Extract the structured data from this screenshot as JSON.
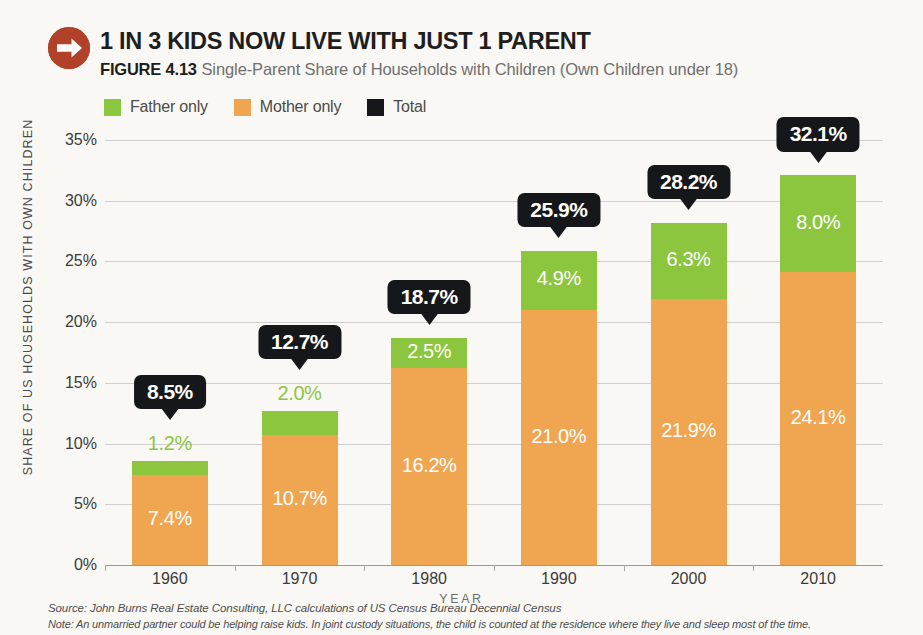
{
  "header": {
    "badge_icon": "arrow-right-circle-icon",
    "badge_color": "#b2412a",
    "headline": "1 IN 3 KIDS NOW LIVE WITH JUST 1 PARENT",
    "figure_number": "FIGURE 4.13",
    "figure_caption": "Single-Parent Share of Households with Children (Own Children under 18)"
  },
  "legend": {
    "items": [
      {
        "label": "Father only",
        "color": "#8cc63e"
      },
      {
        "label": "Mother only",
        "color": "#f0a550"
      },
      {
        "label": "Total",
        "color": "#16171a"
      }
    ]
  },
  "footnotes": {
    "source": "Source: John Burns Real Estate Consulting, LLC calculations of US Census Bureau Decennial Census",
    "note": "Note: An unmarried partner could be helping raise kids. In joint custody situations, the child is counted at the residence where they live and sleep most of the time."
  },
  "chart_data": {
    "type": "bar",
    "subtype": "stacked",
    "title": "Single-Parent Share of Households with Children (Own Children under 18)",
    "xlabel": "YEAR",
    "ylabel": "SHARE OF US HOUSEHOLDS WITH OWN CHILDREN",
    "categories": [
      "1960",
      "1970",
      "1980",
      "1990",
      "2000",
      "2010"
    ],
    "ylim": [
      0,
      35
    ],
    "ytick_labels": [
      "0%",
      "5%",
      "10%",
      "15%",
      "20%",
      "25%",
      "30%",
      "35%"
    ],
    "ytick_values": [
      0,
      5,
      10,
      15,
      20,
      25,
      30,
      35
    ],
    "grid": true,
    "legend_position": "top-left",
    "series": [
      {
        "name": "Mother only",
        "color": "#f0a550",
        "values": [
          7.4,
          10.7,
          16.2,
          21.0,
          21.9,
          24.1
        ],
        "labels": [
          "7.4%",
          "10.7%",
          "16.2%",
          "21.0%",
          "21.9%",
          "24.1%"
        ]
      },
      {
        "name": "Father only",
        "color": "#8cc63e",
        "values": [
          1.2,
          2.0,
          2.5,
          4.9,
          6.3,
          8.0
        ],
        "labels": [
          "1.2%",
          "2.0%",
          "2.5%",
          "4.9%",
          "6.3%",
          "8.0%"
        ]
      }
    ],
    "totals": {
      "name": "Total",
      "color": "#16171a",
      "values": [
        8.5,
        12.7,
        18.7,
        25.9,
        28.2,
        32.1
      ],
      "labels": [
        "8.5%",
        "12.7%",
        "18.7%",
        "25.9%",
        "28.2%",
        "32.1%"
      ]
    }
  }
}
